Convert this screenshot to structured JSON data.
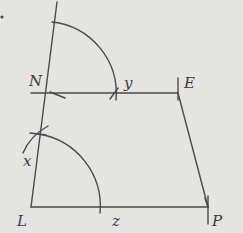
{
  "diagram": {
    "type": "geometric-construction",
    "points": {
      "N": {
        "label": "N",
        "x": 44,
        "y": 93
      },
      "E": {
        "label": "E",
        "x": 178,
        "y": 93
      },
      "L": {
        "label": "L",
        "x": 31,
        "y": 207
      },
      "P": {
        "label": "P",
        "x": 208,
        "y": 207
      }
    },
    "arc_labels": {
      "x": "x",
      "y": "y",
      "z": "z"
    },
    "colors": {
      "background": "#e4e4e2",
      "stroke": "#4a4a4a",
      "text": "#3a3a3a"
    }
  }
}
